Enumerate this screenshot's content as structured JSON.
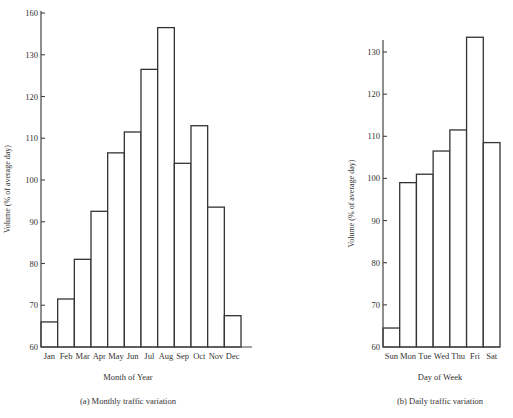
{
  "chart_data": [
    {
      "id": "monthly",
      "type": "bar",
      "title": "(a) Monthly traffic variation",
      "xlabel": "Month of Year",
      "ylabel": "Volume (% of average day)",
      "categories": [
        "Jan",
        "Feb",
        "Mar",
        "Apr",
        "May",
        "Jun",
        "Jul",
        "Aug",
        "Sep",
        "Oct",
        "Nov",
        "Dec"
      ],
      "values": [
        66,
        71.5,
        81,
        92.5,
        106.5,
        111.5,
        126.5,
        136.5,
        104,
        113,
        93.5,
        67.5
      ],
      "yticks": [
        {
          "value": 60,
          "label": "60"
        },
        {
          "value": 70,
          "label": "70"
        },
        {
          "value": 80,
          "label": "80"
        },
        {
          "value": 90,
          "label": "90"
        },
        {
          "value": 100,
          "label": "100"
        },
        {
          "value": 110,
          "label": "110"
        },
        {
          "value": 120,
          "label": "120"
        },
        {
          "value": 130,
          "label": "130"
        },
        {
          "value": 140,
          "label": "160"
        }
      ],
      "ylim": [
        60,
        140
      ],
      "grid": false,
      "legend": null
    },
    {
      "id": "daily",
      "type": "bar",
      "title": "(b) Daily traffic variation",
      "xlabel": "Day of Week",
      "ylabel": "Volume (% of average day)",
      "categories": [
        "Sun",
        "Mon",
        "Tue",
        "Wed",
        "Thu",
        "Fri",
        "Sat"
      ],
      "values": [
        64.5,
        99,
        101,
        106.5,
        111.5,
        133.5,
        108.5
      ],
      "yticks": [
        {
          "value": 60,
          "label": "60"
        },
        {
          "value": 70,
          "label": "70"
        },
        {
          "value": 80,
          "label": "80"
        },
        {
          "value": 90,
          "label": "90"
        },
        {
          "value": 100,
          "label": "100"
        },
        {
          "value": 110,
          "label": "110"
        },
        {
          "value": 120,
          "label": "120"
        },
        {
          "value": 130,
          "label": "130"
        }
      ],
      "ylim": [
        60,
        133
      ],
      "grid": false,
      "legend": null
    }
  ],
  "layout": {
    "monthly": {
      "x0": 41,
      "y0": 347,
      "yTop": 13,
      "vTop": 140,
      "width": 200,
      "axisTop": 11,
      "axisRight": 252,
      "ylabelX": 10,
      "centerX": 128
    },
    "daily": {
      "x0": 383,
      "y0": 347,
      "yTop": 52,
      "vTop": 130,
      "width": 117,
      "axisTop": 40,
      "axisRight": 500,
      "ylabelX": 354,
      "centerX": 440
    }
  },
  "colors": {
    "bar_fill": "#ffffff",
    "bar_stroke": "#333333",
    "axis": "#444444",
    "background": "#ffffff"
  }
}
